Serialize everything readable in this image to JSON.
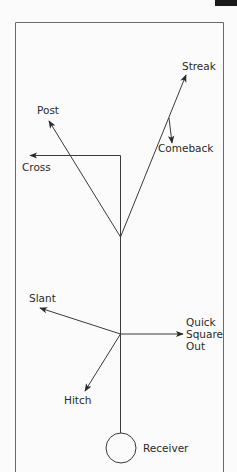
{
  "diagram": {
    "colors": {
      "background": "#fbfbfb",
      "stroke": "#3a3a3a",
      "text": "#2a2a2a",
      "border": "#6a6a6a"
    },
    "routes": [
      {
        "id": "streak",
        "label": "Streak"
      },
      {
        "id": "comeback",
        "label": "Comeback"
      },
      {
        "id": "post",
        "label": "Post"
      },
      {
        "id": "cross",
        "label": "Cross"
      },
      {
        "id": "slant",
        "label": "Slant"
      },
      {
        "id": "quick-square-out",
        "label_lines": [
          "Quick",
          "Square",
          "Out"
        ]
      },
      {
        "id": "hitch",
        "label": "Hitch"
      }
    ],
    "player": {
      "label": "Receiver"
    }
  }
}
